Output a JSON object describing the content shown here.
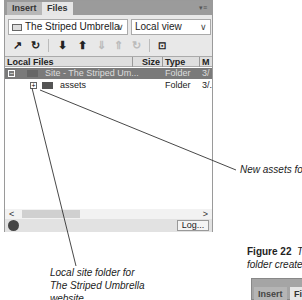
{
  "panel": {
    "tabs": [
      {
        "label": "Insert"
      },
      {
        "label": "Files"
      }
    ],
    "panel_menu_icon": "panel-menu-icon",
    "site_select": {
      "value": "The Striped Umbrella"
    },
    "view_select": {
      "value": "Local view"
    },
    "toolbar": [
      "connect-icon",
      "refresh-icon",
      "get-icon",
      "put-icon",
      "check-out-icon",
      "check-in-icon",
      "sync-icon",
      "expand-icon"
    ],
    "columns": [
      {
        "label": "Local Files"
      },
      {
        "label": "Size"
      },
      {
        "label": "Type"
      },
      {
        "label": "M"
      }
    ],
    "rows": [
      {
        "expander": "−",
        "name": "Site - The Striped Um...",
        "size": "",
        "type": "Folder",
        "modified": "3/",
        "selected": true
      },
      {
        "expander": "+",
        "name": "assets",
        "size": "",
        "type": "Folder",
        "modified": "3/.",
        "selected": false
      }
    ],
    "scroll_left": "<",
    "scroll_right": ">",
    "log_button": "Log..."
  },
  "callouts": {
    "new_assets": "New assets folder",
    "local_site_line1": "Local site folder for",
    "local_site_line2": "The Striped Umbrella",
    "local_site_line3": "website"
  },
  "figure": {
    "number": "Figure 22",
    "caption_line1": "Th",
    "caption_line2": "folder created ("
  },
  "mini_panel": {
    "tabs": [
      {
        "label": "Insert"
      },
      {
        "label": "Fil"
      }
    ]
  }
}
